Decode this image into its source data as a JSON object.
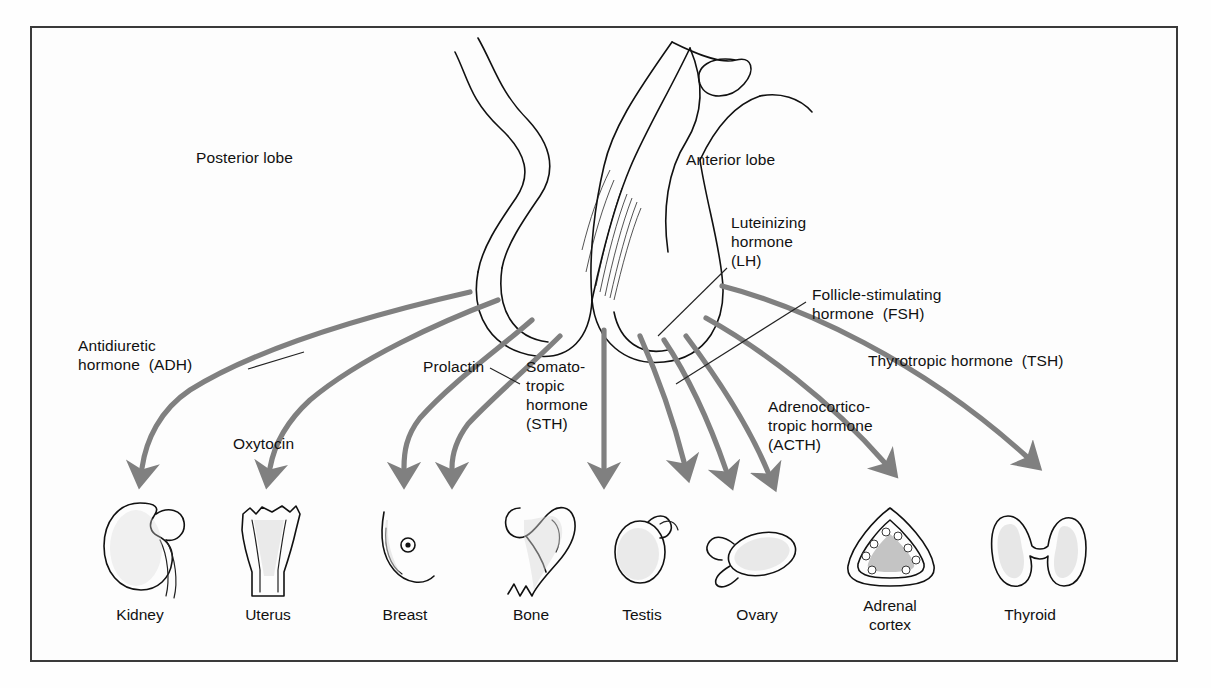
{
  "figure": {
    "type": "anatomical-diagram",
    "border_color": "#3a3a3a",
    "arrow_color": "#808080",
    "outline_color": "#111111",
    "background_color": "#fdfdfd"
  },
  "gland_labels": {
    "posterior": "Posterior lobe",
    "anterior": "Anterior lobe"
  },
  "hormones": [
    {
      "id": "adh",
      "text": "Antidiuretic\nhormone  (ADH)",
      "x": 78,
      "y": 336,
      "leader": true
    },
    {
      "id": "oxytocin",
      "text": "Oxytocin",
      "x": 233,
      "y": 434,
      "leader": false
    },
    {
      "id": "prolactin",
      "text": "Prolactin",
      "x": 423,
      "y": 357,
      "leader": true
    },
    {
      "id": "sth",
      "text": "Somato-\ntropic\nhormone\n(STH)",
      "x": 526,
      "y": 357,
      "leader": false
    },
    {
      "id": "lh",
      "text": "Luteinizing\nhormone\n(LH)",
      "x": 731,
      "y": 213,
      "leader": true
    },
    {
      "id": "fsh",
      "text": "Follicle-stimulating\nhormone  (FSH)",
      "x": 812,
      "y": 285,
      "leader": true
    },
    {
      "id": "acth",
      "text": "Adrenocortico-\ntropic hormone\n(ACTH)",
      "x": 768,
      "y": 397,
      "leader": false
    },
    {
      "id": "tsh",
      "text": "Thyrotropic hormone  (TSH)",
      "x": 868,
      "y": 351,
      "leader": false
    }
  ],
  "organs": [
    {
      "id": "kidney",
      "label": "Kidney",
      "cx": 140,
      "lx": 140,
      "ly": 605
    },
    {
      "id": "uterus",
      "label": "Uterus",
      "cx": 268,
      "lx": 268,
      "ly": 605
    },
    {
      "id": "breast",
      "label": "Breast",
      "cx": 405,
      "lx": 405,
      "ly": 605
    },
    {
      "id": "bone",
      "label": "Bone",
      "cx": 531,
      "lx": 531,
      "ly": 605
    },
    {
      "id": "testis",
      "label": "Testis",
      "cx": 642,
      "lx": 642,
      "ly": 605
    },
    {
      "id": "ovary",
      "label": "Ovary",
      "cx": 757,
      "lx": 757,
      "ly": 605
    },
    {
      "id": "adrenal",
      "label": "Adrenal\ncortex",
      "cx": 890,
      "lx": 890,
      "ly": 596
    },
    {
      "id": "thyroid",
      "label": "Thyroid",
      "cx": 1030,
      "lx": 1030,
      "ly": 605
    }
  ]
}
